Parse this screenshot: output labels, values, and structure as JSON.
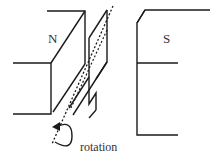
{
  "diagram": {
    "labels": {
      "north_pole": "N",
      "south_pole": "S",
      "rotation": "rotation"
    },
    "colors": {
      "stroke": "#1a1a1a",
      "background": "#ffffff"
    },
    "elements": [
      "north-magnet",
      "south-magnet",
      "coil-loop",
      "rotation-axis",
      "rotation-arrow"
    ]
  }
}
